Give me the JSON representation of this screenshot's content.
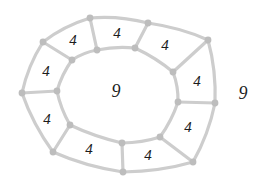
{
  "diagram": {
    "type": "planar-graph-ring",
    "canvas": {
      "width": 266,
      "height": 192,
      "background": "#ffffff"
    },
    "style": {
      "edge_color": "#cdcdcd",
      "edge_width": 3.2,
      "node_color": "#bdbdbd",
      "node_radius": 3.4,
      "label_color": "#1c1c1c"
    },
    "outer_cycle_vertices": [
      [
        90,
        18
      ],
      [
        148,
        23
      ],
      [
        208,
        40
      ],
      [
        215,
        103
      ],
      [
        193,
        162
      ],
      [
        123,
        172
      ],
      [
        53,
        152
      ],
      [
        22,
        93
      ],
      [
        43,
        42
      ]
    ],
    "inner_cycle_vertices": [
      [
        97,
        50
      ],
      [
        135,
        48
      ],
      [
        173,
        72
      ],
      [
        178,
        102
      ],
      [
        160,
        137
      ],
      [
        122,
        143
      ],
      [
        70,
        125
      ],
      [
        57,
        91
      ],
      [
        72,
        60
      ]
    ],
    "spoke_pairs": [
      [
        0,
        0
      ],
      [
        1,
        1
      ],
      [
        2,
        2
      ],
      [
        3,
        3
      ],
      [
        4,
        4
      ],
      [
        5,
        5
      ],
      [
        6,
        6
      ],
      [
        7,
        7
      ],
      [
        8,
        8
      ]
    ],
    "quad_face_labels": [
      {
        "text": "4",
        "x": 73,
        "y": 40
      },
      {
        "text": "4",
        "x": 117,
        "y": 33
      },
      {
        "text": "4",
        "x": 165,
        "y": 45
      },
      {
        "text": "4",
        "x": 197,
        "y": 81
      },
      {
        "text": "4",
        "x": 188,
        "y": 127
      },
      {
        "text": "4",
        "x": 148,
        "y": 155
      },
      {
        "text": "4",
        "x": 89,
        "y": 149
      },
      {
        "text": "4",
        "x": 47,
        "y": 119
      },
      {
        "text": "4",
        "x": 46,
        "y": 71
      }
    ],
    "inner_face_label": {
      "text": "9",
      "x": 116,
      "y": 91
    },
    "outer_face_label": {
      "text": "9",
      "x": 243,
      "y": 93
    }
  }
}
